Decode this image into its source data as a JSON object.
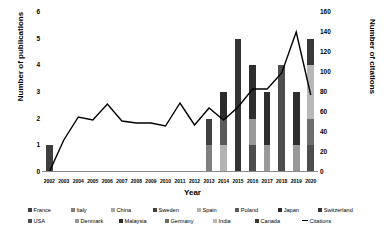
{
  "chart_data": {
    "type": "bar",
    "title": "",
    "xlabel": "Year",
    "ylabel": "Number of publications",
    "y2label": "Number of citations",
    "ylim": [
      0,
      6
    ],
    "y2lim": [
      0,
      160
    ],
    "ytick_labels": [
      "0",
      "1",
      "2",
      "3",
      "4",
      "5",
      "6"
    ],
    "y2tick_labels": [
      "0",
      "20",
      "40",
      "60",
      "80",
      "100",
      "120",
      "140",
      "160"
    ],
    "grid": false,
    "legend_position": "bottom",
    "categories": [
      "2002",
      "2003",
      "2004",
      "2005",
      "2006",
      "2007",
      "2008",
      "2009",
      "2010",
      "2011",
      "2012",
      "2013",
      "2014",
      "2015",
      "2016",
      "2017",
      "2018",
      "2019",
      "2020"
    ],
    "series": [
      {
        "name": "France",
        "color": "#3f3f3f",
        "values": [
          1,
          0,
          0,
          0,
          0,
          0,
          0,
          0,
          0,
          0,
          0,
          0,
          0,
          0,
          0,
          0,
          0,
          0,
          0
        ]
      },
      {
        "name": "Italy",
        "color": "#7f7f7f",
        "values": [
          0,
          0,
          0,
          0,
          0,
          0,
          0,
          0,
          0,
          0,
          0,
          1,
          0,
          0,
          0,
          0,
          0,
          0,
          0
        ]
      },
      {
        "name": "China",
        "color": "#a6a6a6",
        "values": [
          0,
          0,
          0,
          0,
          0,
          0,
          0,
          0,
          0,
          0,
          0,
          0,
          0,
          0,
          0,
          0,
          0,
          0,
          0
        ]
      },
      {
        "name": "Sweden",
        "color": "#404040",
        "values": [
          0,
          0,
          0,
          0,
          0,
          0,
          0,
          0,
          0,
          0,
          0,
          1,
          0,
          0,
          0,
          0,
          0,
          0,
          0
        ]
      },
      {
        "name": "Spain",
        "color": "#b3b3b3",
        "values": [
          0,
          0,
          0,
          0,
          0,
          0,
          0,
          0,
          0,
          0,
          0,
          0,
          1,
          0,
          0,
          0,
          0,
          0,
          0
        ]
      },
      {
        "name": "Poland",
        "color": "#5a5a5a",
        "values": [
          0,
          0,
          0,
          0,
          0,
          0,
          0,
          0,
          0,
          0,
          0,
          0,
          1,
          0,
          0,
          0,
          0,
          0,
          0
        ]
      },
      {
        "name": "Japan",
        "color": "#2b2b2b",
        "values": [
          0,
          0,
          0,
          0,
          0,
          0,
          0,
          0,
          0,
          0,
          0,
          0,
          1,
          0,
          0,
          0,
          0,
          0,
          0
        ]
      },
      {
        "name": "Switzerland",
        "color": "#333333",
        "values": [
          0,
          0,
          0,
          0,
          0,
          0,
          0,
          0,
          0,
          0,
          0,
          0,
          0,
          5,
          0,
          0,
          0,
          0,
          0
        ]
      },
      {
        "name": "USA",
        "color": "#4d4d4d",
        "values": [
          0,
          0,
          0,
          0,
          0,
          0,
          0,
          0,
          0,
          0,
          0,
          0,
          0,
          0,
          1,
          0,
          4,
          0,
          1
        ]
      },
      {
        "name": "Denmark",
        "color": "#999999",
        "values": [
          0,
          0,
          0,
          0,
          0,
          0,
          0,
          0,
          0,
          0,
          0,
          0,
          0,
          0,
          1,
          1,
          0,
          1,
          0
        ]
      },
      {
        "name": "Malaysia",
        "color": "#2e2e2e",
        "values": [
          0,
          0,
          0,
          0,
          0,
          0,
          0,
          0,
          0,
          0,
          0,
          0,
          0,
          0,
          2,
          2,
          0,
          2,
          0
        ]
      },
      {
        "name": "Germany",
        "color": "#6e6e6e",
        "values": [
          0,
          0,
          0,
          0,
          0,
          0,
          0,
          0,
          0,
          0,
          0,
          0,
          0,
          0,
          0,
          0,
          0,
          0,
          1
        ]
      },
      {
        "name": "India",
        "color": "#b8b8b8",
        "values": [
          0,
          0,
          0,
          0,
          0,
          0,
          0,
          0,
          0,
          0,
          0,
          0,
          0,
          0,
          0,
          0,
          0,
          0,
          2
        ]
      },
      {
        "name": "Canada",
        "color": "#383838",
        "values": [
          0,
          0,
          0,
          0,
          0,
          0,
          0,
          0,
          0,
          0,
          0,
          0,
          0,
          0,
          0,
          0,
          0,
          0,
          1
        ]
      }
    ],
    "bar_totals": [
      1,
      0,
      0,
      0,
      0,
      0,
      0,
      0,
      0,
      0,
      0,
      2,
      3,
      5,
      4,
      3,
      4,
      3,
      5
    ],
    "line_series": {
      "name": "Citations",
      "color": "#000000",
      "values": [
        0,
        32,
        55,
        52,
        68,
        51,
        49,
        49,
        46,
        69,
        47,
        64,
        52,
        65,
        83,
        83,
        99,
        140,
        77
      ]
    }
  },
  "legend": {
    "row1": [
      {
        "label": "France",
        "color": "#3f3f3f"
      },
      {
        "label": "Italy",
        "color": "#7f7f7f"
      },
      {
        "label": "China",
        "color": "#a6a6a6"
      },
      {
        "label": "Sweden",
        "color": "#404040"
      },
      {
        "label": "Spain",
        "color": "#b3b3b3"
      },
      {
        "label": "Poland",
        "color": "#5a5a5a"
      },
      {
        "label": "Japan",
        "color": "#2b2b2b"
      },
      {
        "label": "Switzerland",
        "color": "#333333"
      }
    ],
    "row2": [
      {
        "label": "USA",
        "color": "#4d4d4d"
      },
      {
        "label": "Denmark",
        "color": "#999999"
      },
      {
        "label": "Malaysia",
        "color": "#2e2e2e"
      },
      {
        "label": "Germany",
        "color": "#6e6e6e"
      },
      {
        "label": "India",
        "color": "#b8b8b8"
      },
      {
        "label": "Canada",
        "color": "#383838"
      },
      {
        "label": "Citations",
        "color": "#000000"
      }
    ]
  }
}
